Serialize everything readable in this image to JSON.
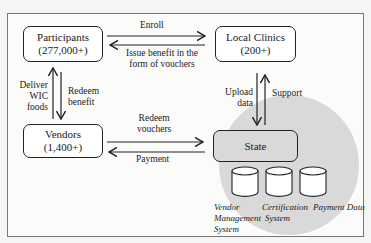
{
  "diagram": {
    "nodes": {
      "participants": {
        "title": "Participants",
        "count": "(277,000+)"
      },
      "clinics": {
        "title": "Local Clinics",
        "count": "(200+)"
      },
      "vendors": {
        "title": "Vendors",
        "count": "(1,400+)"
      },
      "state": {
        "title": "State"
      }
    },
    "databases": [
      {
        "line1": "Vendor",
        "line2": "Management",
        "line3": "System"
      },
      {
        "line1": "Certification",
        "line2": "System"
      },
      {
        "line1": "Payment Data"
      }
    ],
    "edges": {
      "enroll": "Enroll",
      "issue_benefit_1": "Issue benefit in the",
      "issue_benefit_2": "form of vouchers",
      "deliver_1": "Deliver",
      "deliver_2": "WIC",
      "deliver_3": "foods",
      "redeem_benefit_1": "Redeem",
      "redeem_benefit_2": "benefit",
      "redeem_vouchers_1": "Redeem",
      "redeem_vouchers_2": "vouchers",
      "payment": "Payment",
      "upload_1": "Upload",
      "upload_2": "data",
      "support": "Support"
    },
    "colors": {
      "state_region": "#d9d9d9",
      "stroke": "#222222"
    }
  }
}
